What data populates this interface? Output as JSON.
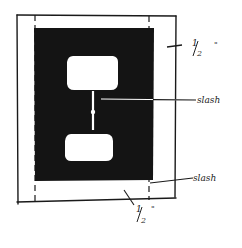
{
  "diagram": {
    "colors": {
      "ink": "#1a1a1a",
      "fill": "#141414",
      "paper": "#ffffff"
    },
    "labels": {
      "top_dimension": "1/2\"",
      "slash_center": "slash",
      "slash_bottom": "slash",
      "bottom_dimension": "1/2\""
    },
    "display": {
      "top_dimension_num": "1",
      "top_dimension_den": "2",
      "top_dimension_mark": "\"",
      "bottom_dimension_num": "1",
      "bottom_dimension_den": "2",
      "bottom_dimension_mark": "\""
    }
  }
}
